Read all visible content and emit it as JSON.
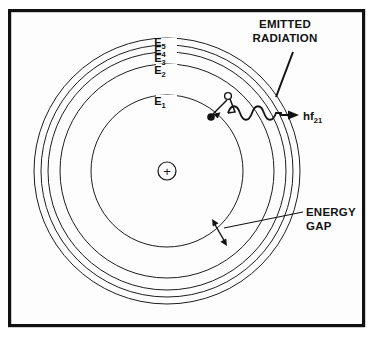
{
  "figure": {
    "background_color": "#ffffff",
    "panel_color": "#fdfdfd",
    "ink_color": "#121212",
    "frame": {
      "x": 8,
      "y": 9,
      "width": 357,
      "height": 318
    }
  },
  "nucleus": {
    "symbol": "+",
    "center_x": 167,
    "center_y": 171,
    "radius": 9,
    "name": "positive nucleus"
  },
  "orbits": [
    {
      "label": "E",
      "subscript": "1",
      "radius": 76,
      "label_x": 166,
      "label_y": 101
    },
    {
      "label": "E",
      "subscript": "2",
      "radius": 107,
      "label_x": 166,
      "label_y": 70
    },
    {
      "label": "E",
      "subscript": "3",
      "radius": 119,
      "label_x": 166,
      "label_y": 58
    },
    {
      "label": "E",
      "subscript": "4",
      "radius": 126,
      "label_x": 166,
      "label_y": 51
    },
    {
      "label": "E",
      "subscript": "5",
      "radius": 133,
      "label_x": 166,
      "label_y": 44
    }
  ],
  "electron_transition": {
    "from_level": "E2",
    "to_level": "E1",
    "start_state": {
      "x": 228,
      "y": 96,
      "style": "open-circle",
      "radius": 3.4
    },
    "end_state": {
      "x": 211,
      "y": 117,
      "style": "filled-circle",
      "radius": 3.6
    }
  },
  "photon": {
    "label": "hf",
    "subscript": "21",
    "label_x": 305,
    "label_y": 121,
    "wave_start_x": 228,
    "wave_end_x": 280,
    "wave_baseline_y": 115,
    "wave_amplitude": 9,
    "wave_cycles": 4,
    "arrow_tip_x": 299,
    "arrow_tip_y": 115
  },
  "annotations": [
    {
      "id": "emitted-radiation",
      "line1": "EMITTED",
      "line2": "RADIATION",
      "text_x": 285,
      "text_y": 28,
      "leader": {
        "x1": 293,
        "y1": 54,
        "x2": 276,
        "y2": 97
      }
    },
    {
      "id": "energy-gap",
      "line1": "ENERGY",
      "line2": "GAP",
      "text_x": 308,
      "text_y": 212,
      "leader": {
        "x1": 302,
        "y1": 214,
        "x2": 224,
        "y2": 229
      },
      "gap_arrow": {
        "x1": 213,
        "y1": 221,
        "x2": 226,
        "y2": 244
      }
    }
  ]
}
